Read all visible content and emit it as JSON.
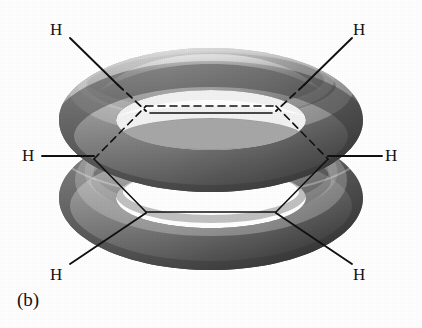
{
  "figure": {
    "caption": "(b)",
    "background_color": "#ffffff",
    "line_color": "#111111",
    "torus_light_color": "#d8d8d8",
    "torus_mid_color": "#9a9a9a",
    "torus_dark_color": "#4a4a4a",
    "torus_shadow_color": "#2e2e2e"
  },
  "atoms": [
    {
      "id": "h-top-left",
      "label": "H",
      "x": 56,
      "y": 29,
      "bond_style": "solid-then-dashed"
    },
    {
      "id": "h-top-right",
      "label": "H",
      "x": 357,
      "y": 29,
      "bond_style": "solid-then-dashed"
    },
    {
      "id": "h-mid-left",
      "label": "H",
      "x": 26,
      "y": 151,
      "bond_style": "solid"
    },
    {
      "id": "h-mid-right",
      "label": "H",
      "x": 387,
      "y": 151,
      "bond_style": "solid"
    },
    {
      "id": "h-bottom-left",
      "label": "H",
      "x": 56,
      "y": 272,
      "bond_style": "solid"
    },
    {
      "id": "h-bottom-right",
      "label": "H",
      "x": 357,
      "y": 272,
      "bond_style": "solid"
    }
  ],
  "hexagon": {
    "description": "carbon skeleton seen edge-on through the torus hole",
    "back_edges_style": "dashed",
    "front_edges_style": "solid",
    "vertices": [
      {
        "id": "c1",
        "x": 94,
        "y": 159
      },
      {
        "id": "c2",
        "x": 146,
        "y": 106
      },
      {
        "id": "c3",
        "x": 276,
        "y": 106
      },
      {
        "id": "c4",
        "x": 328,
        "y": 159
      },
      {
        "id": "c5",
        "x": 276,
        "y": 212
      },
      {
        "id": "c6",
        "x": 146,
        "y": 212
      }
    ]
  },
  "tori": [
    {
      "id": "upper-torus",
      "cx": 211,
      "cy": 120,
      "rx": 152,
      "ry": 72,
      "tube": 46
    },
    {
      "id": "lower-torus",
      "cx": 211,
      "cy": 198,
      "rx": 152,
      "ry": 72,
      "tube": 46
    }
  ]
}
